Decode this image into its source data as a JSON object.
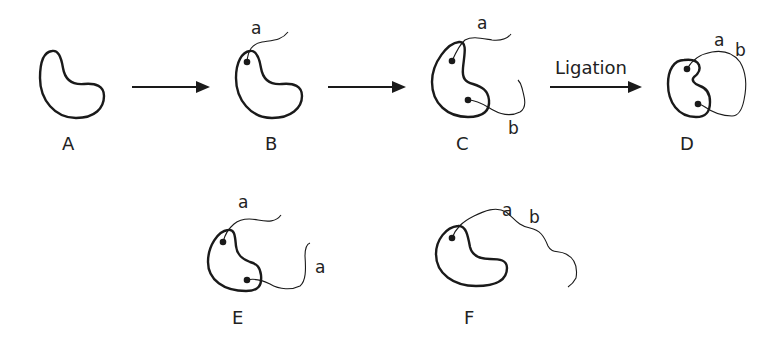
{
  "diagram": {
    "stages": [
      {
        "id": "A",
        "label": "A",
        "strands": []
      },
      {
        "id": "B",
        "label": "B",
        "strands": [
          "a"
        ]
      },
      {
        "id": "C",
        "label": "C",
        "strands": [
          "a",
          "b"
        ]
      },
      {
        "id": "D",
        "label": "D",
        "strands": [
          "a",
          "b"
        ],
        "note": "ligated loop"
      },
      {
        "id": "E",
        "label": "E",
        "strands": [
          "a",
          "a"
        ]
      },
      {
        "id": "F",
        "label": "F",
        "strands": [
          "a b"
        ]
      }
    ],
    "arrows": [
      {
        "from": "A",
        "to": "B",
        "label": ""
      },
      {
        "from": "B",
        "to": "C",
        "label": ""
      },
      {
        "from": "C",
        "to": "D",
        "label": "Ligation"
      }
    ],
    "labels": {
      "A": "A",
      "B": "B",
      "C": "C",
      "D": "D",
      "E": "E",
      "F": "F",
      "B_a": "a",
      "C_a": "a",
      "C_b": "b",
      "D_a": "a",
      "D_b": "b",
      "E_a1": "a",
      "E_a2": "a",
      "F_a": "a",
      "F_b": "b",
      "ligation": "Ligation"
    },
    "colors": {
      "stroke": "#1a1a1a",
      "background": "#ffffff"
    }
  }
}
